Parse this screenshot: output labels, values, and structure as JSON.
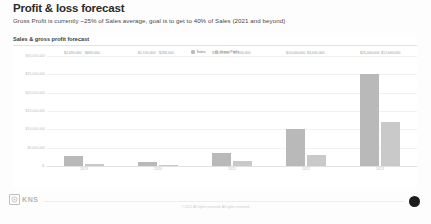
{
  "slide": {
    "title": "Profit & loss forecast",
    "subtitle": "Gross Profit is currently ~25% of Sales average, goal is to get to 40% of Sales (2021 and beyond)"
  },
  "chart_data": {
    "type": "bar",
    "title": "Sales & gross profit forecast",
    "xlabel": "",
    "ylabel": "",
    "grid": true,
    "legend_position": "top-center",
    "categories": [
      "2019",
      "2020",
      "2021",
      "2022",
      "2023"
    ],
    "ylim": [
      0,
      30000000
    ],
    "ytick_labels": [
      "$30,000,000",
      "$25,000,000",
      "$20,000,000",
      "$15,000,000",
      "$10,000,000",
      "$5,000,000",
      "$-"
    ],
    "ytick_values": [
      30000000,
      25000000,
      20000000,
      15000000,
      10000000,
      5000000,
      0
    ],
    "series": [
      {
        "name": "Sales",
        "color": "#b9b9b9",
        "values": [
          2690000,
          1150000,
          3500000,
          10000000,
          25000000
        ],
        "labels": [
          "$2,690,000",
          "$1,150,000",
          "$3,500,000",
          "$10,000,000",
          "$25,000,000"
        ]
      },
      {
        "name": "Gross Profit",
        "color": "#c9c9c9",
        "values": [
          663000,
          283000,
          1400000,
          3000000,
          12000000
        ],
        "labels": [
          "$663,000",
          "$283,000",
          "$1,400,000",
          "$3,000,000",
          "$12,000,000"
        ]
      }
    ]
  },
  "footer": {
    "logo_text": "KNS",
    "copyright": "© 2021 All rights reserved. All rights reserved.",
    "corner_badge": ""
  }
}
